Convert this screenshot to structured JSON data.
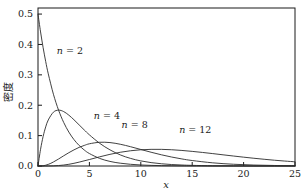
{
  "chart_data": {
    "type": "line",
    "title": "",
    "subtitle": "",
    "xlabel": "x",
    "ylabel": "密度",
    "xlim": [
      0,
      25
    ],
    "ylim": [
      0.0,
      0.52
    ],
    "grid": false,
    "legend_position": "inline-annotations",
    "x_ticks": [
      "0",
      "5",
      "10",
      "15",
      "20",
      "25"
    ],
    "x_tick_values": [
      0,
      5,
      10,
      15,
      20,
      25
    ],
    "y_ticks": [
      "0.0",
      "0.1",
      "0.2",
      "0.3",
      "0.4",
      "0.5"
    ],
    "y_tick_values": [
      0.0,
      0.1,
      0.2,
      0.3,
      0.4,
      0.5
    ],
    "annotations": [
      {
        "text": "n = 2",
        "n": 2,
        "x": 3.1,
        "y": 0.368
      },
      {
        "text": "n = 4",
        "n": 4,
        "x": 6.7,
        "y": 0.155
      },
      {
        "text": "n = 8",
        "n": 8,
        "x": 9.4,
        "y": 0.126
      },
      {
        "text": "n = 12",
        "n": 12,
        "x": 15.3,
        "y": 0.108
      }
    ],
    "series": [
      {
        "name": "n = 2",
        "n": 2,
        "color": "#2b2b2b",
        "peak": {
          "x": 0.0,
          "y": 0.5
        },
        "x": [
          0,
          0.25,
          0.5,
          0.75,
          1,
          1.5,
          2,
          2.5,
          3,
          3.5,
          4,
          4.5,
          5,
          6,
          7,
          8,
          9,
          10,
          11,
          12,
          13,
          14,
          15,
          17,
          19,
          21,
          23,
          25
        ],
        "values": [
          0.5,
          0.4412,
          0.3894,
          0.3436,
          0.3033,
          0.2362,
          0.1839,
          0.1433,
          0.1116,
          0.0869,
          0.0677,
          0.0527,
          0.041,
          0.0249,
          0.0151,
          0.0092,
          0.0056,
          0.0034,
          0.002,
          0.0012,
          0.0008,
          0.0005,
          0.0003,
          0.0001,
          0.0001,
          0.0,
          0.0,
          0.0
        ]
      },
      {
        "name": "n = 4",
        "n": 4,
        "color": "#2b2b2b",
        "peak": {
          "x": 2.0,
          "y": 0.1839
        },
        "x": [
          0,
          0.25,
          0.5,
          0.75,
          1,
          1.5,
          2,
          2.5,
          3,
          3.5,
          4,
          4.5,
          5,
          6,
          7,
          8,
          9,
          10,
          11,
          12,
          13,
          14,
          15,
          17,
          19,
          21,
          23,
          25
        ],
        "values": [
          0.0,
          0.0551,
          0.0974,
          0.1288,
          0.1516,
          0.1772,
          0.1839,
          0.1791,
          0.1673,
          0.1521,
          0.1353,
          0.1186,
          0.1026,
          0.0747,
          0.0532,
          0.0366,
          0.025,
          0.0168,
          0.0112,
          0.0074,
          0.0048,
          0.0032,
          0.0021,
          0.0008,
          0.0004,
          0.0001,
          0.0001,
          0.0
        ]
      },
      {
        "name": "n = 8",
        "n": 8,
        "color": "#2b2b2b",
        "peak": {
          "x": 6.0,
          "y": 0.112
        },
        "x": [
          0,
          0.5,
          1,
          1.5,
          2,
          2.5,
          3,
          3.5,
          4,
          4.5,
          5,
          6,
          7,
          8,
          9,
          10,
          11,
          12,
          13,
          14,
          15,
          17,
          19,
          21,
          23,
          25
        ],
        "values": [
          0.0,
          0.0008,
          0.0053,
          0.0132,
          0.023,
          0.0336,
          0.0438,
          0.0531,
          0.0613,
          0.0677,
          0.0731,
          0.0781,
          0.0771,
          0.0716,
          0.0635,
          0.0544,
          0.0453,
          0.0369,
          0.0295,
          0.0232,
          0.018,
          0.0104,
          0.0058,
          0.0031,
          0.0017,
          0.0009
        ]
      },
      {
        "name": "n = 12",
        "n": 12,
        "color": "#2b2b2b",
        "peak": {
          "x": 10.0,
          "y": 0.0882
        },
        "x": [
          0,
          1,
          2,
          3,
          4,
          5,
          6,
          7,
          8,
          9,
          10,
          11,
          12,
          13,
          14,
          15,
          16,
          17,
          18,
          19,
          20,
          21,
          22,
          23,
          24,
          25
        ],
        "values": [
          0.0,
          0.0001,
          0.0015,
          0.0056,
          0.0127,
          0.0213,
          0.0302,
          0.0384,
          0.0452,
          0.0502,
          0.0534,
          0.0548,
          0.0548,
          0.0535,
          0.0512,
          0.0481,
          0.0446,
          0.0408,
          0.0368,
          0.0329,
          0.0291,
          0.0255,
          0.0221,
          0.019,
          0.0163,
          0.0138
        ]
      }
    ],
    "note_scaled_series": {
      "n8_peak_rendered": 0.112,
      "n12_peak_rendered": 0.0882
    }
  },
  "style": {
    "axis_color": "#1a1a1a",
    "curve_color": "#2b2b2b",
    "background": "#ffffff"
  }
}
